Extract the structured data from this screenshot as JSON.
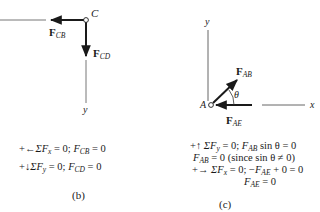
{
  "figure_b": {
    "node_label": "C",
    "axis_label_y": "y",
    "force_cb": {
      "symbol": "F",
      "subscript": "CB"
    },
    "force_cd": {
      "symbol": "F",
      "subscript": "CD"
    },
    "equations": [
      {
        "prefix": "+←",
        "text": "ΣF",
        "sub": "x",
        "rest": " = 0; ",
        "var": "F",
        "varsub": "CB",
        "result": " = 0"
      },
      {
        "prefix": "+↓",
        "text": "ΣF",
        "sub": "y",
        "rest": " = 0; ",
        "var": "F",
        "varsub": "CD",
        "result": " = 0"
      }
    ],
    "caption": "(b)"
  },
  "figure_c": {
    "node_label": "A",
    "axis_label_x": "x",
    "axis_label_y": "y",
    "angle_label": "θ",
    "force_ab": {
      "symbol": "F",
      "subscript": "AB"
    },
    "force_ae": {
      "symbol": "F",
      "subscript": "AE"
    },
    "equations": {
      "line1": {
        "prefix": "+↑ ",
        "text": "ΣF",
        "sub": "y",
        "rest": " = 0; ",
        "var": "F",
        "varsub": "AB",
        "tail": " sin θ = 0"
      },
      "line2": {
        "var": "F",
        "varsub": "AB",
        "tail": " = 0 (since sin θ ≠ 0)"
      },
      "line3": {
        "prefix": "+→",
        "text": " ΣF",
        "sub": "x",
        "rest": " = 0; −",
        "var": "F",
        "varsub": "AE",
        "tail": " + 0 = 0"
      },
      "line4": {
        "var": "F",
        "varsub": "AE",
        "tail": " = 0"
      }
    },
    "caption": "(c)"
  },
  "colors": {
    "ink": "#1a1a1a",
    "line": "#555555",
    "node_fill": "#ffffff"
  }
}
